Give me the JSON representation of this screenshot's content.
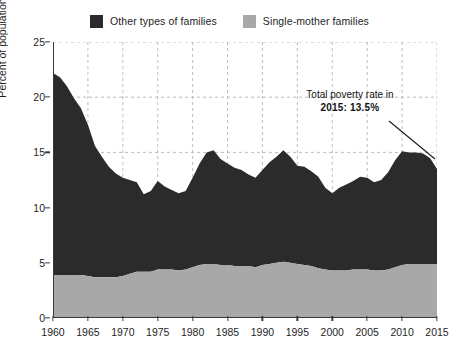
{
  "legend": {
    "entries": [
      {
        "label": "Other types of families",
        "color": "#2b2b2b",
        "icon": "legend-swatch-dark"
      },
      {
        "label": "Single-mother families",
        "color": "#a8a8a8",
        "icon": "legend-swatch-gray"
      }
    ]
  },
  "annotation": {
    "line1": "Total poverty rate in",
    "line2": "2015: 13.5%"
  },
  "chart_data": {
    "type": "area",
    "stacked": true,
    "title": "",
    "xlabel": "",
    "ylabel": "Percent of population",
    "xlim": [
      1960,
      2015
    ],
    "ylim": [
      0,
      25
    ],
    "xticks": [
      1960,
      1965,
      1970,
      1975,
      1980,
      1985,
      1990,
      1995,
      2000,
      2005,
      2010,
      2015
    ],
    "yticks": [
      0,
      5,
      10,
      15,
      20,
      25
    ],
    "grid": true,
    "legend_position": "top-center",
    "colors": {
      "other": "#2b2b2b",
      "single_mother": "#a8a8a8",
      "grid": "#b5b5b5",
      "axis": "#3a3a3a"
    },
    "x": [
      1960,
      1961,
      1962,
      1963,
      1964,
      1965,
      1966,
      1967,
      1968,
      1969,
      1970,
      1971,
      1972,
      1973,
      1974,
      1975,
      1976,
      1977,
      1978,
      1979,
      1980,
      1981,
      1982,
      1983,
      1984,
      1985,
      1986,
      1987,
      1988,
      1989,
      1990,
      1991,
      1992,
      1993,
      1994,
      1995,
      1996,
      1997,
      1998,
      1999,
      2000,
      2001,
      2002,
      2003,
      2004,
      2005,
      2006,
      2007,
      2008,
      2009,
      2010,
      2011,
      2012,
      2013,
      2014,
      2015
    ],
    "series": [
      {
        "name": "Single-mother families",
        "color": "#a8a8a8",
        "values": [
          3.9,
          3.9,
          3.9,
          3.9,
          3.9,
          3.8,
          3.7,
          3.7,
          3.7,
          3.7,
          3.8,
          4.0,
          4.2,
          4.2,
          4.2,
          4.4,
          4.4,
          4.4,
          4.3,
          4.4,
          4.6,
          4.8,
          4.9,
          4.9,
          4.8,
          4.8,
          4.7,
          4.7,
          4.7,
          4.6,
          4.8,
          4.9,
          5.0,
          5.1,
          5.0,
          4.9,
          4.8,
          4.7,
          4.5,
          4.4,
          4.3,
          4.3,
          4.3,
          4.4,
          4.4,
          4.4,
          4.3,
          4.3,
          4.4,
          4.6,
          4.8,
          4.9,
          4.9,
          4.9,
          4.9,
          4.9
        ]
      },
      {
        "name": "Other types of families",
        "color": "#2b2b2b",
        "values": [
          18.3,
          17.9,
          17.1,
          16.0,
          15.1,
          13.7,
          11.9,
          10.9,
          10.0,
          9.4,
          8.9,
          8.5,
          8.1,
          7.0,
          7.3,
          8.0,
          7.5,
          7.2,
          7.0,
          7.1,
          8.1,
          9.2,
          10.1,
          10.3,
          9.6,
          9.2,
          8.9,
          8.7,
          8.3,
          8.1,
          8.6,
          9.2,
          9.6,
          10.1,
          9.6,
          8.9,
          8.9,
          8.6,
          8.3,
          7.4,
          7.0,
          7.5,
          7.8,
          8.0,
          8.4,
          8.3,
          8.0,
          8.2,
          8.8,
          9.7,
          10.3,
          10.1,
          10.1,
          10.0,
          9.6,
          8.6
        ]
      }
    ],
    "total": {
      "name": "Total poverty rate",
      "values": [
        22.2,
        21.8,
        21.0,
        19.9,
        19.0,
        17.5,
        15.6,
        14.6,
        13.7,
        13.1,
        12.7,
        12.5,
        12.3,
        11.2,
        11.5,
        12.4,
        11.9,
        11.6,
        11.3,
        11.5,
        12.7,
        14.0,
        15.0,
        15.2,
        14.4,
        14.0,
        13.6,
        13.4,
        13.0,
        12.7,
        13.4,
        14.1,
        14.6,
        15.2,
        14.6,
        13.8,
        13.7,
        13.3,
        12.8,
        11.8,
        11.3,
        11.8,
        12.1,
        12.4,
        12.8,
        12.7,
        12.3,
        12.5,
        13.2,
        14.3,
        15.1,
        15.0,
        15.0,
        14.9,
        14.5,
        13.5
      ]
    },
    "annotations": [
      {
        "text": "Total poverty rate in 2015: 13.5%",
        "x": 2015,
        "y": 13.5
      }
    ]
  }
}
